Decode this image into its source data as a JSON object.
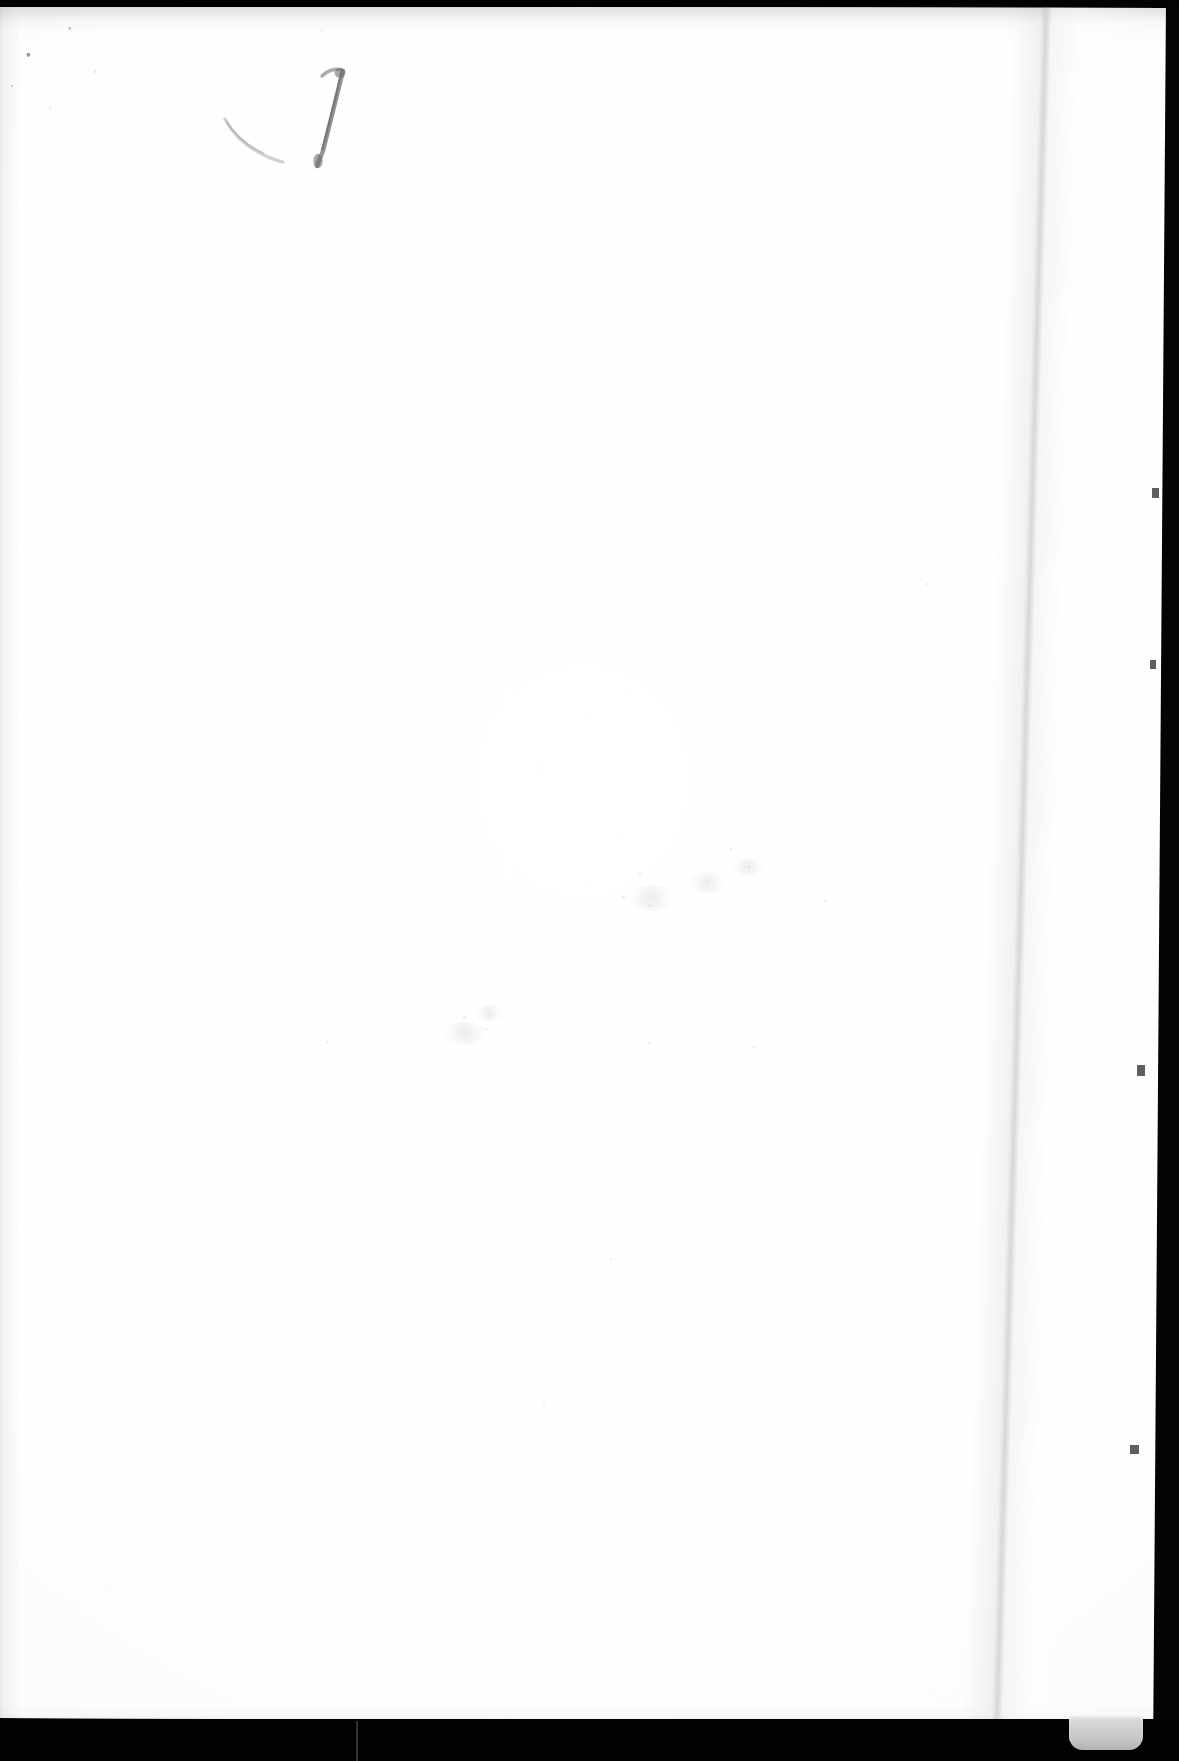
{
  "document": {
    "type": "scanned-page",
    "description": "Blank flyleaf / front endpaper of a scanned book, recto side",
    "page_label": "1",
    "page_content_text": "",
    "body_text": ""
  },
  "annotations": {
    "handwritten_page_number": {
      "text": "1",
      "medium": "pencil",
      "location": "upper-left",
      "color": "#6b6b6b"
    },
    "handwritten_stroke": {
      "text": "",
      "description": "faint curved pencil stroke left of the numeral",
      "color": "#9a9a9a"
    }
  },
  "scan_features": {
    "paper_color": "#fdfdfd",
    "backdrop_color": "#040404",
    "fold_line_color": "#a8a8a8",
    "tab_color": "#c9c9c9",
    "top_band_label": "scanner-bed-top",
    "bottom_band_label": "scanner-bed-bottom",
    "right_gap_label": "scanner-gap-right",
    "tab_label": "page-marker-tab",
    "fold_label": "page-fold-crease"
  },
  "marks": {
    "smudges": [
      {
        "x": 640,
        "y": 885,
        "w": 46,
        "h": 26
      },
      {
        "x": 700,
        "y": 872,
        "w": 38,
        "h": 22
      },
      {
        "x": 745,
        "y": 858,
        "w": 30,
        "h": 18
      },
      {
        "x": 455,
        "y": 1022,
        "w": 44,
        "h": 22
      },
      {
        "x": 487,
        "y": 1005,
        "w": 28,
        "h": 16
      }
    ],
    "specks": [
      {
        "x": 634,
        "y": 896,
        "d": 3
      },
      {
        "x": 661,
        "y": 905,
        "d": 2
      },
      {
        "x": 651,
        "y": 872,
        "d": 2
      },
      {
        "x": 742,
        "y": 848,
        "d": 2
      },
      {
        "x": 760,
        "y": 866,
        "d": 2
      },
      {
        "x": 836,
        "y": 900,
        "d": 2
      },
      {
        "x": 475,
        "y": 1016,
        "d": 3
      },
      {
        "x": 497,
        "y": 1028,
        "d": 2
      },
      {
        "x": 338,
        "y": 1041,
        "d": 2
      },
      {
        "x": 660,
        "y": 1042,
        "d": 2
      },
      {
        "x": 765,
        "y": 1046,
        "d": 2
      },
      {
        "x": 555,
        "y": 1402,
        "d": 2
      },
      {
        "x": 622,
        "y": 1258,
        "d": 2
      },
      {
        "x": 938,
        "y": 583,
        "d": 2
      },
      {
        "x": 333,
        "y": 29,
        "d": 2
      }
    ],
    "edge_nicks": [
      {
        "x": 1152,
        "y": 488,
        "w": 7,
        "h": 10
      },
      {
        "x": 1150,
        "y": 660,
        "w": 6,
        "h": 9
      },
      {
        "x": 1137,
        "y": 1065,
        "w": 8,
        "h": 11
      },
      {
        "x": 1130,
        "y": 1445,
        "w": 9,
        "h": 9
      }
    ]
  }
}
